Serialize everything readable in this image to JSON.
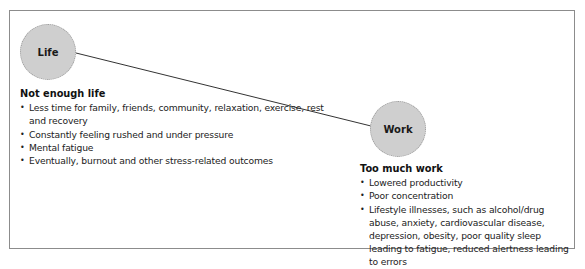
{
  "diagram": {
    "nodes": [
      {
        "id": "life",
        "label": "Life"
      },
      {
        "id": "work",
        "label": "Work"
      }
    ],
    "connector": {
      "from": "life",
      "to": "work"
    },
    "life_section": {
      "heading": "Not enough life",
      "items": [
        "Less time for family, friends, community, relaxation, exercise, rest and recovery",
        "Constantly feeling rushed and under pressure",
        "Mental fatigue",
        "Eventually, burnout and other stress-related outcomes"
      ]
    },
    "work_section": {
      "heading": "Too much work",
      "items": [
        "Lowered productivity",
        "Poor concentration",
        "Lifestyle illnesses, such as alcohol/drug abuse, anxiety, cardiovascular disease, depression, obesity, poor quality sleep leading to fatigue, reduced alertness leading to errors"
      ]
    },
    "colors": {
      "node_fill": "#cfcfcf",
      "node_border": "#9a9a9a",
      "frame_border": "#8c8c8c",
      "line": "#333333"
    }
  }
}
